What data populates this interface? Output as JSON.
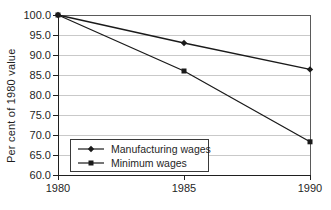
{
  "chart_data": {
    "type": "line",
    "x": [
      1980,
      1985,
      1990
    ],
    "x_tick_labels": [
      "1980",
      "1985",
      "1990"
    ],
    "xlim": [
      1980,
      1990
    ],
    "series": [
      {
        "name": "Manufacturing wages",
        "marker": "diamond",
        "values": [
          100.0,
          93.0,
          86.4
        ]
      },
      {
        "name": "Minimum wages",
        "marker": "square",
        "values": [
          100.0,
          86.0,
          68.3
        ]
      }
    ],
    "title": "",
    "xlabel": "",
    "ylabel": "Per cent of 1980 value",
    "ylim": [
      60,
      100
    ],
    "ytick_step": 5,
    "ytick_labels": [
      "100.0",
      "95.0",
      "90.0",
      "85.0",
      "80.0",
      "75.0",
      "70.0",
      "65.0",
      "60.0"
    ],
    "grid": true,
    "legend_position": "inside-bottom-left",
    "legend_border": true,
    "colors": {
      "line": "#1a1a1a",
      "grid": "#c9c9c9",
      "frame": "#5a5a5a",
      "axis": "#1f1f1f",
      "text": "#1f1f1f",
      "background": "#ffffff"
    }
  }
}
